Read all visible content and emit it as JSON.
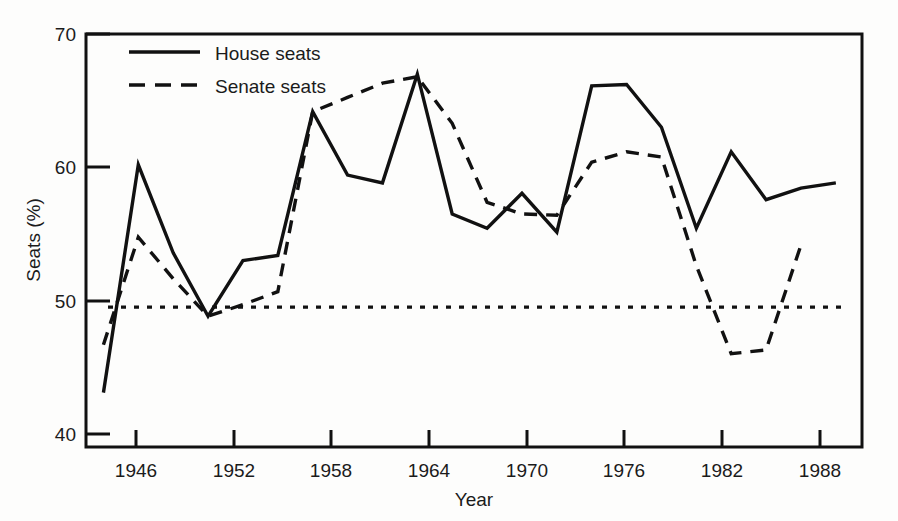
{
  "chart_data": {
    "type": "line",
    "title": "",
    "xlabel": "Year",
    "ylabel": "Seats (%)",
    "xlim": [
      1945,
      1989.5
    ],
    "ylim": [
      39.0,
      70.9
    ],
    "grid": false,
    "legend_position": "top-left",
    "x_ticks": [
      1946,
      1952,
      1958,
      1964,
      1970,
      1976,
      1982,
      1988
    ],
    "x_tick_labels": [
      "1946",
      "1952",
      "1958",
      "1964",
      "1970",
      "1976",
      "1982",
      "1988"
    ],
    "y_ticks": [
      40,
      50,
      60,
      70
    ],
    "y_tick_labels": [
      "40",
      "50",
      "60",
      "70"
    ],
    "reference_line": {
      "label": "50% majority line",
      "y": 49.8,
      "style": "dotted"
    },
    "x": [
      1946,
      1948,
      1950,
      1952,
      1954,
      1956,
      1958,
      1960,
      1962,
      1964,
      1966,
      1968,
      1970,
      1972,
      1974,
      1976,
      1978,
      1980,
      1982,
      1984,
      1986,
      1988
    ],
    "series": [
      {
        "name": "House seats",
        "style": "solid",
        "values": [
          43.2,
          60.8,
          54.0,
          49.1,
          53.4,
          53.8,
          64.9,
          60.0,
          59.4,
          67.8,
          57.0,
          55.9,
          58.6,
          55.6,
          66.9,
          67.0,
          63.7,
          55.9,
          61.8,
          58.1,
          59.0,
          59.4
        ]
      },
      {
        "name": "Senate seats",
        "style": "dashed",
        "values": [
          46.9,
          55.2,
          52.0,
          49.1,
          50.0,
          51.0,
          64.9,
          66.0,
          67.1,
          67.6,
          64.0,
          57.9,
          57.0,
          56.9,
          61.0,
          61.8,
          61.4,
          53.0,
          46.2,
          46.5,
          54.6,
          null
        ]
      }
    ]
  },
  "legend": {
    "entries": [
      {
        "label": "House seats",
        "style": "solid"
      },
      {
        "label": "Senate seats",
        "style": "dashed"
      }
    ]
  },
  "axes": {
    "y_title": "Seats (%)",
    "x_title": "Year"
  }
}
